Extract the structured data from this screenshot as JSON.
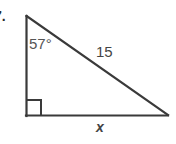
{
  "figure": {
    "type": "right-triangle-diagram",
    "background_color": "#ffffff",
    "stroke_color": "#3a3a3a",
    "item_number": "7.",
    "labels": {
      "angle": "57°",
      "hypotenuse": "15",
      "base": "x"
    },
    "geometry": {
      "top_vertex": [
        26,
        16
      ],
      "bottom_left_vertex": [
        26,
        116
      ],
      "bottom_right_vertex": [
        168,
        115
      ],
      "right_angle_marker": {
        "at_vertex": "bottom_left",
        "size": 14
      }
    },
    "annotations": {
      "angle_value_degrees": 57,
      "hypotenuse_length": 15,
      "unknown_side": "x",
      "unknown_side_position": "base"
    }
  }
}
